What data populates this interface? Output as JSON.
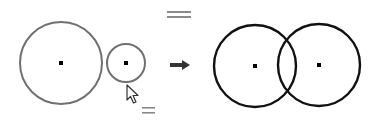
{
  "diagram": {
    "colors": {
      "before_stroke": "#707070",
      "after_stroke": "#111111",
      "center_point": "#000000",
      "symbol": "#8a8a8a",
      "arrow": "#333333",
      "background": "#ffffff"
    },
    "before": {
      "circle_large": {
        "cx": 61,
        "cy": 63,
        "r": 41
      },
      "circle_small": {
        "cx": 126,
        "cy": 63,
        "r": 19
      },
      "equal_symbol_top": {
        "x": 167,
        "y": 11,
        "w": 24
      },
      "equal_symbol_bottom": {
        "x": 142,
        "y": 107,
        "w": 13
      },
      "cursor": {
        "x": 127,
        "y": 85
      }
    },
    "arrow": {
      "x1": 170,
      "x2": 190,
      "y": 65
    },
    "after": {
      "circle_left": {
        "cx": 255,
        "cy": 66,
        "r": 41
      },
      "circle_right": {
        "cx": 319,
        "cy": 65,
        "r": 41
      }
    }
  }
}
